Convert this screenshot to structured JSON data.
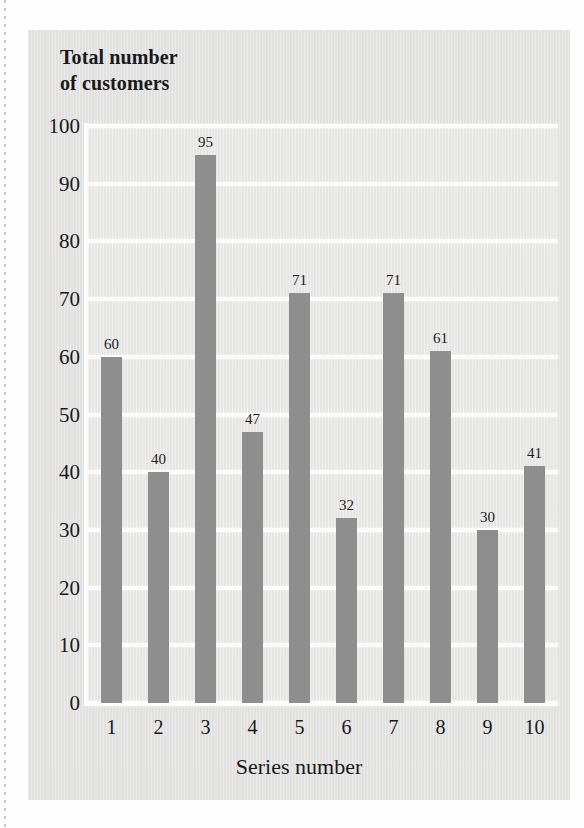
{
  "chart_data": {
    "type": "bar",
    "title": "Total number of customers",
    "title_lines": [
      "Total number",
      "of customers"
    ],
    "xlabel": "Series number",
    "ylabel": "Total number of customers",
    "categories": [
      "1",
      "2",
      "3",
      "4",
      "5",
      "6",
      "7",
      "8",
      "9",
      "10"
    ],
    "values": [
      60,
      40,
      95,
      47,
      71,
      32,
      71,
      61,
      30,
      41
    ],
    "value_labels": [
      "60",
      "40",
      "95",
      "47",
      "71",
      "32",
      "71",
      "61",
      "30",
      "41"
    ],
    "ylim": [
      0,
      100
    ],
    "ytick_labels": [
      "100",
      "90",
      "80",
      "70",
      "60",
      "50",
      "40",
      "30",
      "20",
      "10",
      "0"
    ],
    "ytick_values": [
      100,
      90,
      80,
      70,
      60,
      50,
      40,
      30,
      20,
      10,
      0
    ],
    "grid": "horizontal",
    "legend": "none",
    "bar_color": "#8e8e8e",
    "gridline_color": "#fbfbfb",
    "plot_background": "#e8e8e7",
    "card_background": "#e3e3e2",
    "text_color": "#19191b"
  }
}
